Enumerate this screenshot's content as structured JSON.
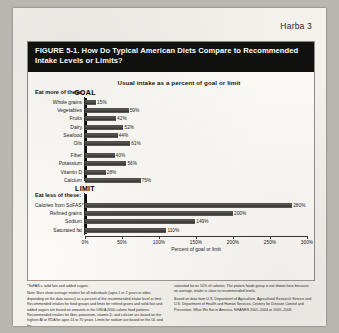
{
  "page": {
    "running_head": "Harba 3"
  },
  "figure": {
    "title": "FIGURE 5-1. How Do Typical American Diets Compare to Recommended Intake Levels or Limits?",
    "subtitle": "Usual intake as a percent of goal or limit",
    "group_more_label": "Eat more of these:",
    "group_less_label": "Eat less of these:",
    "goal_marker": "GOAL",
    "limit_marker": "LIMIT"
  },
  "chart_data": {
    "type": "bar",
    "orientation": "horizontal",
    "title": "FIGURE 5-1. How Do Typical American Diets Compare to Recommended Intake Levels or Limits?",
    "subtitle": "Usual intake as a percent of goal or limit",
    "xlabel": "Percent of goal or limit",
    "ylabel": "",
    "xlim": [
      0,
      300
    ],
    "grid": false,
    "legend": "none",
    "reference_lines": [
      {
        "label": "GOAL",
        "value": 100,
        "group": "Eat more of these:"
      },
      {
        "label": "LIMIT",
        "value": 100,
        "group": "Eat less of these:"
      }
    ],
    "groups": [
      {
        "name": "Eat more of these:",
        "categories": [
          "Whole grains",
          "Vegetables",
          "Fruits",
          "Dairy",
          "Seafood",
          "Oils",
          "Fiber",
          "Potassium",
          "Vitamin D",
          "Calcium"
        ],
        "values": [
          15,
          59,
          42,
          52,
          44,
          61,
          40,
          56,
          28,
          75
        ],
        "value_labels": [
          "15%",
          "59%",
          "42%",
          "52%",
          "44%",
          "61%",
          "40%",
          "56%",
          "28%",
          "75%"
        ]
      },
      {
        "name": "Eat less of these:",
        "categories": [
          "Calories from SoFAS*",
          "Refined grains",
          "Sodium",
          "Saturated fat"
        ],
        "values": [
          280,
          200,
          149,
          110
        ],
        "value_labels": [
          "280%",
          "200%",
          "149%",
          "110%"
        ]
      }
    ],
    "xticks": [
      0,
      50,
      100,
      150,
      200,
      250,
      300
    ],
    "xtick_labels": [
      "0%",
      "50%",
      "100%",
      "150%",
      "200%",
      "250%",
      "300%"
    ]
  },
  "footnotes": {
    "left": [
      "*SoFAS = solid fats and added sugars.",
      "Note: Bars show average intakes for all individuals (ages 1 or 2 years or older, depending on the data source) as a percent of the recommended intake level or limit. Recommended intakes for food groups and limits for refined grains and solid fats and added sugars are based on amounts in the USDA 2000-calorie food patterns. Recommended intakes for fiber, potassium, vitamin D, and calcium are based on the highest AI or RDA for ages 14 to 70 years. Limits for sodium are based on the UL and for"
    ],
    "right": [
      "saturated fat on 10% of calories. The protein foods group is not shown here because, on average, intake is close to recommended levels.",
      "Based on data from U.S. Department of Agriculture, Agricultural Research Service and U.S. Department of Health and Human Services, Centers for Disease Control and Prevention, What We Eat in America, NHANES 2001–2004 or 2005–2006."
    ]
  }
}
